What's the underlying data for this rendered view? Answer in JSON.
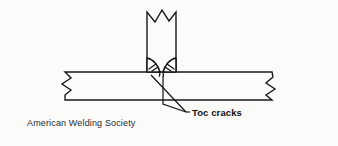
{
  "figure": {
    "background_color": "#fbfbfa",
    "line_color": "#1a1a1a",
    "width": 338,
    "height": 146
  },
  "annotations": {
    "toe_cracks_label": "Toc cracks",
    "source_credit": "American Welding Society"
  },
  "parts": {
    "vertical_member_name": "vertical-member-plate",
    "horizontal_member_name": "horizontal-base-plate",
    "left_weld_name": "left-fillet-weld-bead",
    "right_weld_name": "right-fillet-weld-bead",
    "left_crack_name": "left-toe-crack",
    "right_crack_name": "right-toe-crack"
  },
  "geometry": {
    "vertical_left_x": 147,
    "vertical_right_x": 176,
    "vertical_top_y": 12,
    "plate_top_y": 72,
    "plate_bottom_y": 100,
    "plate_left_x": 65,
    "plate_right_x": 272
  }
}
